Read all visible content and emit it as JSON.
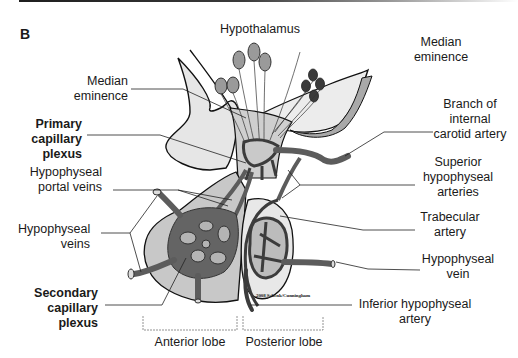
{
  "panel_letter": "B",
  "labels": {
    "hypothalamus": "Hypothalamus",
    "median_eminence_left": [
      "Median",
      "eminence"
    ],
    "median_eminence_right": [
      "Median",
      "eminence"
    ],
    "primary_capillary_plexus": [
      "Primary",
      "capillary",
      "plexus"
    ],
    "hypophyseal_portal_veins": [
      "Hypophyseal",
      "portal veins"
    ],
    "hypophyseal_veins": [
      "Hypophyseal",
      "veins"
    ],
    "secondary_capillary_plexus": [
      "Secondary",
      "capillary",
      "plexus"
    ],
    "branch_internal_carotid": [
      "Branch of",
      "internal",
      "carotid artery"
    ],
    "superior_hypophyseal_arteries": [
      "Superior",
      "hypophyseal",
      "arteries"
    ],
    "trabecular_artery": [
      "Trabecular",
      "artery"
    ],
    "hypophyseal_vein": [
      "Hypophyseal",
      "vein"
    ],
    "inferior_hypophyseal_artery": [
      "Inferior hypophyseal",
      "artery"
    ],
    "anterior_lobe": "Anterior lobe",
    "posterior_lobe": "Posterior lobe"
  },
  "copyright": "2008 Schenk/Cunningham",
  "colors": {
    "tissue_light": "#e4e4e4",
    "tissue_mid": "#bdbdbd",
    "vessel_dark": "#5c5c5c",
    "vessel_darker": "#3c3c3c",
    "outline": "#111111",
    "leader": "#222222"
  }
}
